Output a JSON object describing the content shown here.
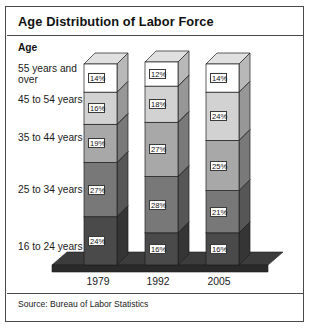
{
  "title": "Age Distribution of Labor Force",
  "age_header": "Age",
  "source": "Source: Bureau of Labor Statistics",
  "categories_display": [
    "55 years and\nover",
    "45 to 54 years",
    "35 to 44 years",
    "25 to 34 years",
    "16 to 24 years"
  ],
  "chart_data": {
    "type": "bar",
    "subtype": "stacked-column-3d",
    "title": "Age Distribution of Labor Force",
    "xlabel": "",
    "ylabel": "Age",
    "categories": [
      "1979",
      "1992",
      "2005"
    ],
    "stack_order_top_to_bottom": [
      "55 years and over",
      "45 to 54 years",
      "35 to 44 years",
      "25 to 34 years",
      "16 to 24 years"
    ],
    "series": [
      {
        "name": "55 years and over",
        "values": [
          14,
          12,
          14
        ],
        "color": "#ffffff"
      },
      {
        "name": "45 to 54 years",
        "values": [
          16,
          18,
          24
        ],
        "color": "#d2d2d2"
      },
      {
        "name": "35 to 44 years",
        "values": [
          19,
          27,
          25
        ],
        "color": "#a8a8a8"
      },
      {
        "name": "25 to 34 years",
        "values": [
          27,
          28,
          21
        ],
        "color": "#787878"
      },
      {
        "name": "16 to 24 years",
        "values": [
          24,
          16,
          16
        ],
        "color": "#4a4a4a"
      }
    ],
    "value_labels": {
      "1979": [
        "14%",
        "16%",
        "19%",
        "27%",
        "24%"
      ],
      "1992": [
        "12%",
        "18%",
        "27%",
        "28%",
        "16%"
      ],
      "2005": [
        "14%",
        "24%",
        "25%",
        "21%",
        "16%"
      ]
    },
    "ylim": [
      0,
      100
    ],
    "unit": "%",
    "grid": false,
    "legend": "none"
  },
  "colors": {
    "frame": "#4a4a4a",
    "base_top": "#3c3c3c",
    "base_front": "#2a2a2a",
    "text": "#1a1a1a"
  }
}
